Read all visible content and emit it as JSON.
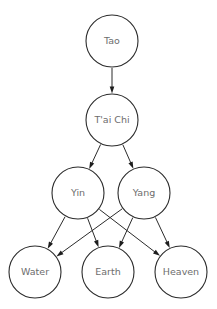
{
  "diagram": {
    "background_color": "#ffffff",
    "node_stroke_color": "#2b2b2b",
    "node_fill_color": "#ffffff",
    "label_color": "#6d6d6d",
    "edge_color": "#2b2b2b",
    "arrowhead_color": "#1d1d1d",
    "nodes": [
      {
        "id": "tao",
        "label": "Tao",
        "cx": 112,
        "cy": 41,
        "r": 26,
        "level": 0
      },
      {
        "id": "taichi",
        "label": "T'ai Chi",
        "cx": 112,
        "cy": 120,
        "r": 26,
        "level": 1
      },
      {
        "id": "yin",
        "label": "Yin",
        "cx": 78,
        "cy": 193,
        "r": 26,
        "level": 2
      },
      {
        "id": "yang",
        "label": "Yang",
        "cx": 144,
        "cy": 193,
        "r": 26,
        "level": 2
      },
      {
        "id": "water",
        "label": "Water",
        "cx": 35,
        "cy": 272,
        "r": 26,
        "level": 3
      },
      {
        "id": "earth",
        "label": "Earth",
        "cx": 108,
        "cy": 272,
        "r": 26,
        "level": 3
      },
      {
        "id": "heaven",
        "label": "Heaven",
        "cx": 181,
        "cy": 272,
        "r": 26,
        "level": 3
      }
    ],
    "edges": [
      {
        "id": "tao-taichi",
        "from": "tao",
        "to": "taichi"
      },
      {
        "id": "taichi-yin",
        "from": "taichi",
        "to": "yin"
      },
      {
        "id": "taichi-yang",
        "from": "taichi",
        "to": "yang"
      },
      {
        "id": "yin-water",
        "from": "yin",
        "to": "water"
      },
      {
        "id": "yin-earth",
        "from": "yin",
        "to": "earth"
      },
      {
        "id": "yin-heaven",
        "from": "yin",
        "to": "heaven"
      },
      {
        "id": "yang-water",
        "from": "yang",
        "to": "water"
      },
      {
        "id": "yang-earth",
        "from": "yang",
        "to": "earth"
      },
      {
        "id": "yang-heaven",
        "from": "yang",
        "to": "heaven"
      }
    ]
  }
}
